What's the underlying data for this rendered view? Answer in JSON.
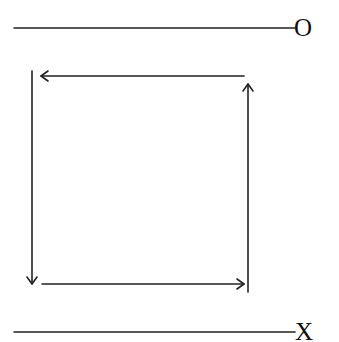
{
  "diagram": {
    "type": "cycle-between-two-lines",
    "stroke_color": "#222222",
    "top_line": {
      "label": "O",
      "x1": 14,
      "y1": 28,
      "x2": 295,
      "y2": 28
    },
    "bottom_line": {
      "label": "X",
      "x1": 14,
      "y1": 332,
      "x2": 295,
      "y2": 332
    },
    "arrows": [
      {
        "id": "top",
        "direction": "left",
        "x1": 244,
        "y1": 76,
        "x2": 40,
        "y2": 76
      },
      {
        "id": "left",
        "direction": "down",
        "x1": 32,
        "y1": 71,
        "x2": 32,
        "y2": 284
      },
      {
        "id": "bottom",
        "direction": "right",
        "x1": 42,
        "y1": 284,
        "x2": 244,
        "y2": 284
      },
      {
        "id": "right",
        "direction": "up",
        "x1": 248,
        "y1": 292,
        "x2": 248,
        "y2": 84
      }
    ]
  }
}
